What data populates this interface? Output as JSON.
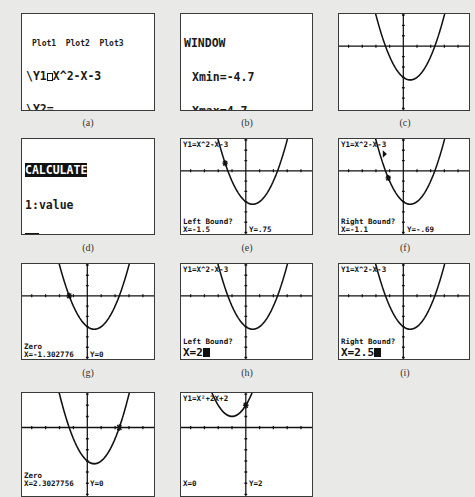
{
  "panels": {
    "a": {
      "caption": "(a)",
      "screen": "Y= editor",
      "plots": [
        "Plot1",
        "Plot2",
        "Plot3"
      ],
      "functions": [
        {
          "name": "\\Y1",
          "expr": "X^2-X-3",
          "selected": true
        },
        {
          "name": "\\Y2",
          "expr": ""
        },
        {
          "name": "\\Y3",
          "expr": ""
        },
        {
          "name": "\\Y4",
          "expr": ""
        },
        {
          "name": "\\Y5",
          "expr": ""
        },
        {
          "name": "\\Y6",
          "expr": ""
        },
        {
          "name": "\\Y7",
          "expr": ""
        }
      ]
    },
    "b": {
      "caption": "(b)",
      "title": "WINDOW",
      "settings": [
        {
          "key": "Xmin",
          "value": "-4.7"
        },
        {
          "key": "Xmax",
          "value": "4.7"
        },
        {
          "key": "Xscl",
          "value": "1"
        },
        {
          "key": "Ymin",
          "value": "-6"
        },
        {
          "key": "Ymax",
          "value": "3.1"
        },
        {
          "key": "Yscl",
          "value": "1"
        },
        {
          "key": "Xres",
          "value": ""
        }
      ]
    },
    "c": {
      "caption": "(c)"
    },
    "d": {
      "caption": "(d)",
      "title": "CALCULATE",
      "items": [
        {
          "num": "1",
          "label": "value"
        },
        {
          "num": "2",
          "label": "zero",
          "selected": true
        },
        {
          "num": "3",
          "label": "minimum"
        },
        {
          "num": "4",
          "label": "maximum"
        },
        {
          "num": "5",
          "label": "intersect"
        },
        {
          "num": "6",
          "label": "dy/dx"
        },
        {
          "num": "7",
          "label": "∫f(x)dx"
        }
      ]
    },
    "e": {
      "caption": "(e)",
      "func": "Y1=X^2-X-3",
      "prompt": "Left Bound?",
      "x": "X=-1.5",
      "y": "Y=.75"
    },
    "f": {
      "caption": "(f)",
      "func": "Y1=X^2-X-3",
      "prompt": "Right Bound?",
      "x": "X=-1.1",
      "y": "Y=-.69"
    },
    "g": {
      "caption": "(g)",
      "prompt": "Zero",
      "x": "X=-1.302776",
      "y": "Y=0"
    },
    "h": {
      "caption": "(h)",
      "func": "Y1=X^2-X-3",
      "prompt": "Left Bound?",
      "x": "X=2"
    },
    "i": {
      "caption": "(i)",
      "func": "Y1=X^2-X-3",
      "prompt": "Right Bound?",
      "x": "X=2.5"
    },
    "j": {
      "prompt": "Zero",
      "x": "X=2.3027756",
      "y": "Y=0"
    },
    "k": {
      "func": "Y1=X²+2X+2",
      "x": "X=0",
      "y": "Y=2"
    }
  },
  "colors": {
    "background": "#e9eae8",
    "screen": "#ffffff",
    "ink": "#111111"
  },
  "window": {
    "xmin": -4.7,
    "xmax": 4.7,
    "ymin": -6,
    "ymax": 3.1,
    "xscl": 1,
    "yscl": 1
  }
}
